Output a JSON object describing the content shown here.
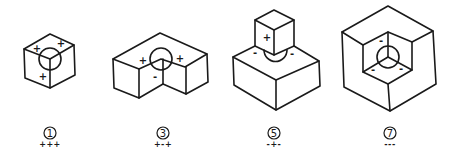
{
  "diagram": {
    "title": "",
    "stroke_color": "#1a1a1a",
    "background": "#ffffff",
    "figures": [
      {
        "id": "fig1",
        "shape": "convex-cube-corner",
        "number": "1",
        "sign_code": "+++",
        "face_signs": [
          "+",
          "+",
          "+"
        ]
      },
      {
        "id": "fig3",
        "shape": "l-shaped-block-concave-edge",
        "number": "3",
        "sign_code": "+-+",
        "face_signs": [
          "+",
          "-",
          "+"
        ]
      },
      {
        "id": "fig5",
        "shape": "cube-on-slab",
        "number": "5",
        "sign_code": "-+-",
        "face_signs": [
          "-",
          "+",
          "-"
        ]
      },
      {
        "id": "fig7",
        "shape": "concave-corner-in-hexagon",
        "number": "7",
        "sign_code": "---",
        "face_signs": [
          "-",
          "-",
          "-"
        ]
      }
    ]
  }
}
